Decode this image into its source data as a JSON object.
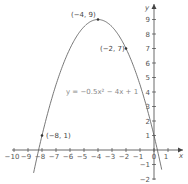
{
  "chart_data": {
    "type": "line",
    "title": "",
    "equation": "y = −0.5x² − 4x + 1",
    "xlabel": "x",
    "ylabel": "y",
    "xlim": [
      -10,
      1
    ],
    "ylim": [
      -2,
      9
    ],
    "x_ticks": [
      -10,
      -9,
      -8,
      -7,
      -6,
      -5,
      -4,
      -3,
      -2,
      -1,
      0,
      1
    ],
    "y_ticks": [
      -2,
      -1,
      1,
      2,
      3,
      4,
      5,
      6,
      7,
      8,
      9
    ],
    "series": [
      {
        "name": "y = −0.5x² − 4x + 1",
        "function": "-0.5*x^2-4*x+1"
      }
    ],
    "points": [
      {
        "label": "(−4, 9)",
        "x": -4,
        "y": 9
      },
      {
        "label": "(−2, 7)",
        "x": -2,
        "y": 7
      },
      {
        "label": "(−8, 1)",
        "x": -8,
        "y": 1
      }
    ],
    "grid": false
  }
}
